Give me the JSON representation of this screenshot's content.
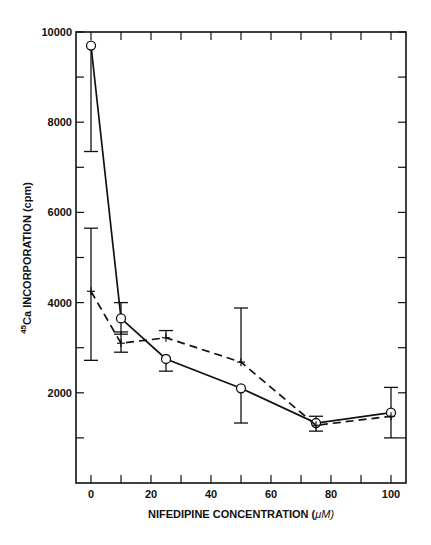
{
  "chart_data": {
    "type": "line",
    "title": "",
    "xlabel": "NIFEDIPINE CONCENTRATION (μM)",
    "xlabel_parts": {
      "main": "NIFEDIPINE CONCENTRATION (",
      "unit": "μM",
      "close": ")"
    },
    "ylabel": "45Ca INCORPORATION (cpm)",
    "ylabel_parts": {
      "superscript": "45",
      "main": "Ca INCORPORATION (cpm)"
    },
    "xlim": [
      0,
      100
    ],
    "ylim": [
      0,
      10000
    ],
    "x_ticks": [
      0,
      20,
      40,
      60,
      80,
      100
    ],
    "x_minor_ticks": [
      10,
      30,
      50,
      70,
      90
    ],
    "y_ticks": [
      2000,
      4000,
      6000,
      8000,
      10000
    ],
    "y_minor_ticks": [
      1000,
      3000,
      5000,
      7000,
      9000
    ],
    "grid": false,
    "legend": null,
    "series": [
      {
        "name": "solid-circles",
        "line_style": "solid",
        "marker": "circle",
        "x": [
          0,
          10,
          25,
          50,
          75,
          100
        ],
        "values": [
          9700,
          3650,
          2750,
          2100,
          1330,
          1560
        ],
        "error_upper": [
          null,
          4000,
          null,
          null,
          1480,
          2120
        ],
        "error_lower": [
          7350,
          3300,
          2480,
          1330,
          null,
          1000
        ]
      },
      {
        "name": "dashed-crosses",
        "line_style": "dashed",
        "marker": "plus",
        "x": [
          0,
          10,
          25,
          50,
          75,
          100
        ],
        "values": [
          4250,
          3100,
          3220,
          2680,
          1280,
          1480
        ],
        "error_upper": [
          5650,
          3350,
          3380,
          3880,
          null,
          null
        ],
        "error_lower": [
          2720,
          2900,
          null,
          null,
          1150,
          null
        ]
      }
    ]
  }
}
